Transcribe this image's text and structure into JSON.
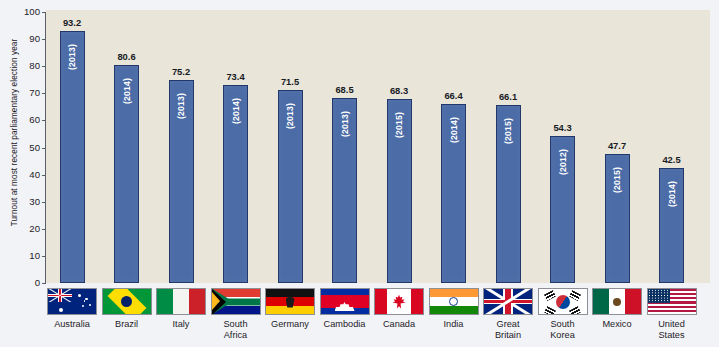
{
  "chart_data": {
    "type": "bar",
    "title": "",
    "xlabel": "",
    "ylabel": "Turnout at most recent parliamentary election year",
    "ylim": [
      0,
      100
    ],
    "ytick_step": 10,
    "yticks": [
      100,
      90,
      80,
      70,
      60,
      50,
      40,
      30,
      20,
      10,
      0
    ],
    "grid": false,
    "legend": "none",
    "value_label_format": "one-decimal",
    "bar_color": "#4c6ca7",
    "bar_border_color": "#22386b",
    "plot_background": "#e9e5d9",
    "page_background": "#f2f3f7",
    "categories": [
      "Australia",
      "Brazil",
      "Italy",
      "South Africa",
      "Germany",
      "Cambodia",
      "Canada",
      "India",
      "Great Britain",
      "South Korea",
      "Mexico",
      "United States"
    ],
    "values": [
      93.2,
      80.6,
      75.2,
      73.4,
      71.5,
      68.5,
      68.3,
      66.4,
      66.1,
      54.3,
      47.7,
      42.5
    ],
    "years": [
      "(2013)",
      "(2014)",
      "(2013)",
      "(2014)",
      "(2013)",
      "(2013)",
      "(2015)",
      "(2014)",
      "(2015)",
      "(2012)",
      "(2015)",
      "(2014)"
    ],
    "bars": [
      {
        "country": "Australia",
        "label_lines": "Australia",
        "value": 93.2,
        "value_label": "93.2",
        "year": "(2013)",
        "flag": "flag-australia"
      },
      {
        "country": "Brazil",
        "label_lines": "Brazil",
        "value": 80.6,
        "value_label": "80.6",
        "year": "(2014)",
        "flag": "flag-brazil"
      },
      {
        "country": "Italy",
        "label_lines": "Italy",
        "value": 75.2,
        "value_label": "75.2",
        "year": "(2013)",
        "flag": "flag-italy"
      },
      {
        "country": "South Africa",
        "label_lines": "South\nAfrica",
        "value": 73.4,
        "value_label": "73.4",
        "year": "(2014)",
        "flag": "flag-south-africa"
      },
      {
        "country": "Germany",
        "label_lines": "Germany",
        "value": 71.5,
        "value_label": "71.5",
        "year": "(2013)",
        "flag": "flag-germany"
      },
      {
        "country": "Cambodia",
        "label_lines": "Cambodia",
        "value": 68.5,
        "value_label": "68.5",
        "year": "(2013)",
        "flag": "flag-cambodia"
      },
      {
        "country": "Canada",
        "label_lines": "Canada",
        "value": 68.3,
        "value_label": "68.3",
        "year": "(2015)",
        "flag": "flag-canada"
      },
      {
        "country": "India",
        "label_lines": "India",
        "value": 66.4,
        "value_label": "66.4",
        "year": "(2014)",
        "flag": "flag-india"
      },
      {
        "country": "Great Britain",
        "label_lines": "Great\nBritain",
        "value": 66.1,
        "value_label": "66.1",
        "year": "(2015)",
        "flag": "flag-great-britain"
      },
      {
        "country": "South Korea",
        "label_lines": "South\nKorea",
        "value": 54.3,
        "value_label": "54.3",
        "year": "(2012)",
        "flag": "flag-south-korea"
      },
      {
        "country": "Mexico",
        "label_lines": "Mexico",
        "value": 47.7,
        "value_label": "47.7",
        "year": "(2015)",
        "flag": "flag-mexico"
      },
      {
        "country": "United States",
        "label_lines": "United\nStates",
        "value": 42.5,
        "value_label": "42.5",
        "year": "(2014)",
        "flag": "flag-united-states"
      }
    ]
  }
}
